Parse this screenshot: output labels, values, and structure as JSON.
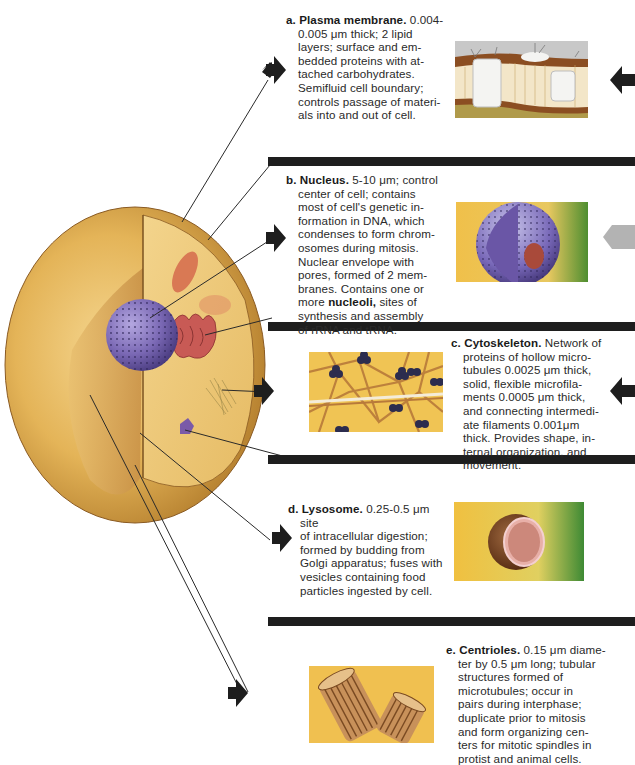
{
  "diagram": {
    "items": [
      {
        "letter": "a.",
        "title": "Plasma membrane.",
        "text": "0.004-0.005 μm thick; 2 lipid layers; surface and embedded proteins with attached carbohydrates. Semifluid cell boundary; controls passage of materials into and out of cell.",
        "lines": [
          "0.004-",
          "0.005 μm thick; 2 lipid",
          "layers; surface and em-",
          "bedded proteins with at-",
          "tached carbohydrates.",
          "Semifluid cell boundary;",
          "controls passage of materi-",
          "als into and out of cell."
        ]
      },
      {
        "letter": "b.",
        "title": "Nucleus.",
        "text": "5-10 μm; control center of cell; contains most of cell's genetic information in DNA, which condenses to form chromosomes during mitosis. Nuclear envelope with pores, formed of 2 membranes. Contains one or more nucleoli, sites of synthesis and assembly of rRNA and tRNA.",
        "lines": [
          "5-10 μm; control",
          "center of cell; contains",
          "most of cell's genetic in-",
          "formation in DNA, which",
          "condenses to form chrom-",
          "osomes during mitosis.",
          "Nuclear envelope with",
          "pores, formed of 2 mem-",
          "branes. Contains one or"
        ],
        "bold_term": "nucleoli,",
        "line_pre_bold": "more ",
        "line_post_bold": " sites of",
        "tail_lines": [
          "synthesis and assembly",
          "of rRNA and tRNA."
        ]
      },
      {
        "letter": "c.",
        "title": "Cytoskeleton.",
        "text": "Network of proteins of hollow microtubules 0.0025 μm thick, solid, flexible microfilaments 0.0005 μm thick, and connecting intermediate filaments 0.001μm thick. Provides shape, internal organization, and movement.",
        "lines": [
          "Network of",
          "proteins of hollow micro-",
          "tubules 0.0025 μm thick,",
          "solid, flexible microfila-",
          "ments 0.0005 μm thick,",
          "and connecting intermedi-",
          "ate filaments 0.001μm",
          "thick. Provides shape, in-",
          "ternal organization, and",
          "movement."
        ]
      },
      {
        "letter": "d.",
        "title": "Lysosome.",
        "text": "0.25-0.5 μm site of intracellular digestion; formed by budding from Golgi apparatus; fuses with vesicles containing food particles ingested by cell.",
        "lines": [
          "0.25-0.5 μm site",
          "of intracellular digestion;",
          "formed by budding from",
          "Golgi apparatus; fuses with",
          "vesicles containing food",
          "particles ingested by cell."
        ]
      },
      {
        "letter": "e.",
        "title": "Centrioles.",
        "text": "0.15 μm diameter by 0.5 μm long; tubular structures formed of microtubules; occur in pairs during interphase; duplicate prior to mitosis and form organizing centers for mitotic spindles in protist and animal cells.",
        "lines": [
          "0.15 μm diame-",
          "ter by 0.5 μm long; tubular",
          "structures formed of",
          "microtubules; occur in",
          "pairs during interphase;",
          "duplicate prior to mitosis",
          "and form organizing cen-",
          "ters for mitotic spindles in",
          "protist and animal cells."
        ]
      }
    ],
    "illustrations": [
      "cell-cutaway-illustration",
      "plasma-membrane-illustration",
      "nucleus-illustration",
      "cytoskeleton-illustration",
      "lysosome-illustration",
      "centrioles-illustration"
    ],
    "colors": {
      "cell_body": "#e6b75a",
      "cell_cut": "#f0cf84",
      "nucleus": "#7e6cb6",
      "er": "#c0504a",
      "bar": "#1e1e1e",
      "gray_arrow": "#b3b3b3",
      "bg_yellow": "#f2c24e",
      "bg_green": "#5a9a3a"
    }
  }
}
